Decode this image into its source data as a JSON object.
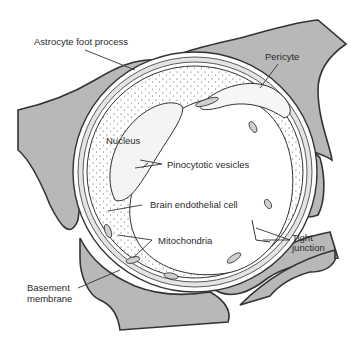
{
  "diagram": {
    "colors": {
      "astrocyte_fill": "#b8b8b8",
      "outline": "#333333",
      "background": "#ffffff"
    },
    "labels": {
      "astrocyte": "Astrocyte foot process",
      "pericyte": "Pericyte",
      "nucleus": "Nucleus",
      "pinocytotic": "Pinocytotic vesicles",
      "endothelial": "Brain endothelial cell",
      "mitochondria": "Mitochondria",
      "tight_junction_1": "Tight",
      "tight_junction_2": "junction",
      "basement_1": "Basement",
      "basement_2": "membrane"
    }
  }
}
